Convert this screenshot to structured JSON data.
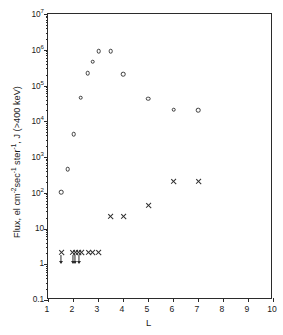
{
  "chart_data": {
    "type": "scatter",
    "title": "",
    "xlabel": "L",
    "ylabel": "Flux, el cm⁻²sec⁻¹ ster⁻¹, J (>400 keV)",
    "xscale": "linear",
    "yscale": "log",
    "xlim": [
      1,
      10
    ],
    "ylim": [
      0.1,
      10000000
    ],
    "grid": false,
    "legend": "none",
    "xticks": [
      "1",
      "2",
      "3",
      "4",
      "5",
      "6",
      "7",
      "8",
      "9",
      "10"
    ],
    "xtick_values": [
      1,
      2,
      3,
      4,
      5,
      6,
      7,
      8,
      9,
      10
    ],
    "ytick_labels": [
      "10⁷",
      "10⁶",
      "10⁵",
      "10⁴",
      "10³",
      "10²",
      "10",
      "1",
      "0.1"
    ],
    "ytick_values": [
      10000000,
      1000000,
      100000,
      10000,
      1000,
      100,
      10,
      1,
      0.1
    ],
    "series": [
      {
        "name": "open-circles",
        "marker": "open-circle",
        "points": [
          {
            "x": 1.52,
            "y": 105
          },
          {
            "x": 1.78,
            "y": 450
          },
          {
            "x": 2.02,
            "y": 4400
          },
          {
            "x": 2.3,
            "y": 46000
          },
          {
            "x": 2.58,
            "y": 220000
          },
          {
            "x": 2.79,
            "y": 460000
          },
          {
            "x": 3.02,
            "y": 900000
          },
          {
            "x": 3.5,
            "y": 900000
          },
          {
            "x": 4.0,
            "y": 210000
          },
          {
            "x": 5.0,
            "y": 43000
          },
          {
            "x": 6.03,
            "y": 21000
          },
          {
            "x": 7.0,
            "y": 20500
          }
        ]
      },
      {
        "name": "crosses",
        "marker": "cross",
        "points": [
          {
            "x": 1.52,
            "y": 2.1,
            "limit": true
          },
          {
            "x": 1.98,
            "y": 2.1,
            "limit": true
          },
          {
            "x": 2.09,
            "y": 2.1,
            "limit": true
          },
          {
            "x": 2.22,
            "y": 2.1,
            "limit": true
          },
          {
            "x": 2.35,
            "y": 2.1,
            "limit": false
          },
          {
            "x": 2.6,
            "y": 2.1,
            "limit": false
          },
          {
            "x": 2.79,
            "y": 2.1,
            "limit": false
          },
          {
            "x": 3.0,
            "y": 2.1,
            "limit": false
          },
          {
            "x": 3.5,
            "y": 21
          },
          {
            "x": 4.0,
            "y": 21
          },
          {
            "x": 5.0,
            "y": 44
          },
          {
            "x": 6.03,
            "y": 210
          },
          {
            "x": 7.0,
            "y": 205
          }
        ]
      }
    ]
  },
  "axes": {
    "x_title": "L",
    "y_title_parts": {
      "p1": "Flux, el cm",
      "s1": "-2",
      "p2": "sec",
      "s2": "-1",
      "p3": " ster",
      "s3": "-1",
      "p4": ", J (>400 keV)"
    }
  }
}
